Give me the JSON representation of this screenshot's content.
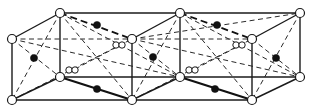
{
  "diagram": {
    "colors": {
      "background": "#ffffff",
      "line": "#1a1a1a",
      "filled_atom": "#111111",
      "open_atom_fill": "#ffffff"
    },
    "nodes": {
      "A": [
        12,
        39
      ],
      "B": [
        12,
        100
      ],
      "C": [
        60,
        13
      ],
      "D": [
        60,
        77
      ],
      "E": [
        132,
        39
      ],
      "F": [
        132,
        100
      ],
      "G": [
        180,
        13
      ],
      "H": [
        180,
        77
      ],
      "I": [
        252,
        39
      ],
      "J": [
        252,
        100
      ],
      "K": [
        300,
        13
      ],
      "L": [
        300,
        77
      ]
    },
    "solid_edges": [
      [
        "A",
        "B"
      ],
      [
        "A",
        "C"
      ],
      [
        "B",
        "F"
      ],
      [
        "F",
        "J"
      ],
      [
        "B",
        "D"
      ],
      [
        "C",
        "D"
      ],
      [
        "C",
        "G"
      ],
      [
        "G",
        "K"
      ],
      [
        "D",
        "H"
      ],
      [
        "H",
        "L"
      ],
      [
        "E",
        "F"
      ],
      [
        "G",
        "H"
      ],
      [
        "I",
        "J"
      ],
      [
        "K",
        "L"
      ],
      [
        "J",
        "L"
      ],
      [
        "F",
        "H"
      ],
      [
        "E",
        "G"
      ],
      [
        "I",
        "K"
      ]
    ],
    "bold_edges": [
      [
        "D",
        "F"
      ],
      [
        "H",
        "J"
      ]
    ],
    "bold_dashed_edges": [
      [
        "C",
        "E"
      ],
      [
        "G",
        "I"
      ]
    ],
    "dashed_edges": [
      [
        "A",
        "E"
      ],
      [
        "E",
        "I"
      ],
      [
        "A",
        "D"
      ],
      [
        "E",
        "H"
      ],
      [
        "I",
        "L"
      ],
      [
        "A",
        "H"
      ],
      [
        "E",
        "L"
      ],
      [
        "C",
        "B"
      ],
      [
        "G",
        "F"
      ],
      [
        "K",
        "J"
      ],
      [
        "C",
        "F"
      ],
      [
        "G",
        "J"
      ],
      [
        "D",
        "E"
      ],
      [
        "H",
        "I"
      ],
      [
        "B",
        "E"
      ],
      [
        "F",
        "I"
      ],
      [
        "E",
        "K"
      ],
      [
        "C",
        "H"
      ],
      [
        "G",
        "L"
      ]
    ],
    "lattice_atoms": [
      {
        "id": "A",
        "r": 4.5
      },
      {
        "id": "B",
        "r": 4.5
      },
      {
        "id": "C",
        "r": 4.5
      },
      {
        "id": "D",
        "r": 4.5
      },
      {
        "id": "E",
        "r": 4.5
      },
      {
        "id": "F",
        "r": 4.5
      },
      {
        "id": "G",
        "r": 4.5
      },
      {
        "id": "H",
        "r": 4.5
      },
      {
        "id": "I",
        "r": 4.5
      },
      {
        "id": "J",
        "r": 4.5
      },
      {
        "id": "K",
        "r": 4.5
      },
      {
        "id": "L",
        "r": 4.5
      }
    ],
    "small_open_atoms": [
      [
        69,
        70,
        3.2
      ],
      [
        75,
        70,
        3.2
      ],
      [
        116,
        45,
        3.2
      ],
      [
        122,
        45,
        3.2
      ],
      [
        189,
        70,
        3.2
      ],
      [
        195,
        70,
        3.2
      ],
      [
        236,
        45,
        3.2
      ],
      [
        242,
        45,
        3.2
      ]
    ],
    "filled_atoms": [
      [
        34,
        58,
        3.6
      ],
      [
        97,
        25,
        3.6
      ],
      [
        97,
        89,
        3.6
      ],
      [
        153,
        57,
        3.6
      ],
      [
        217,
        25,
        3.6
      ],
      [
        215,
        89,
        3.6
      ],
      [
        276,
        58,
        3.6
      ]
    ]
  }
}
